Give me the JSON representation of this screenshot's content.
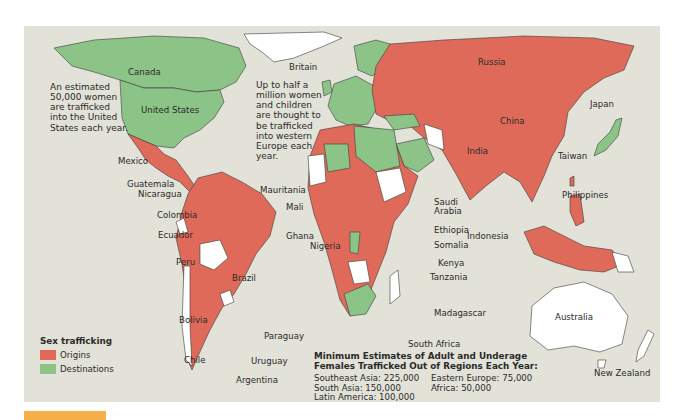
{
  "map": {
    "title_legend": "Sex trafficking",
    "legend": [
      {
        "label": "Origins",
        "color": "#e06a5a"
      },
      {
        "label": "Destinations",
        "color": "#8cc487"
      }
    ],
    "colors": {
      "background": "#e2e2d8",
      "origins": "#e06a5a",
      "destinations": "#8cc487",
      "neutral": "#ffffff",
      "figure_tab": "#f5b04a"
    },
    "notes": {
      "us_note": "An estimated 50,000 women are trafficked into the United States each year.",
      "europe_note": "Up to half a million women and children are thought to be trafficked into western Europe each year."
    },
    "labels": {
      "canada": "Canada",
      "united_states": "United States",
      "mexico": "Mexico",
      "guatemala": "Guatemala",
      "nicaragua": "Nicaragua",
      "colombia": "Colombia",
      "ecuador": "Ecuador",
      "peru": "Peru",
      "brazil": "Brazil",
      "bolivia": "Bolivia",
      "paraguay": "Paraguay",
      "chile": "Chile",
      "uruguay": "Uruguay",
      "argentina": "Argentina",
      "britain": "Britain",
      "mauritania": "Mauritania",
      "mali": "Mali",
      "ghana": "Ghana",
      "nigeria": "Nigeria",
      "saudi_arabia": "Saudi Arabia",
      "ethiopia": "Ethiopia",
      "somalia": "Somalia",
      "kenya": "Kenya",
      "tanzania": "Tanzania",
      "madagascar": "Madagascar",
      "south_africa": "South Africa",
      "russia": "Russia",
      "china": "China",
      "india": "India",
      "japan": "Japan",
      "taiwan": "Taiwan",
      "philippines": "Philippines",
      "indonesia": "Indonesia",
      "australia": "Australia",
      "new_zealand": "New Zealand"
    },
    "stats": {
      "title_line1": "Minimum Estimates of Adult and Underage",
      "title_line2": "Females Trafficked Out of Regions Each Year:",
      "items": [
        "Southeast Asia: 225,000",
        "Eastern Europe: 75,000",
        "South Asia: 150,000",
        "Africa: 50,000",
        "Latin America: 100,000",
        ""
      ]
    }
  }
}
